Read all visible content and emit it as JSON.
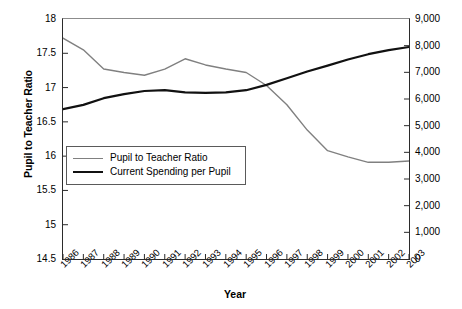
{
  "chart_data": {
    "type": "line",
    "title": "",
    "xlabel": "Year",
    "ylabel": "Pupil to Teacher Ratio",
    "ylabel_right": "",
    "grid": false,
    "legend_position": "inside-left-middle",
    "categories": [
      "1986",
      "1987",
      "1988",
      "1989",
      "1990",
      "1991",
      "1992",
      "1993",
      "1994",
      "1995",
      "1996",
      "1997",
      "1998",
      "1999",
      "2000",
      "2001",
      "2002",
      "2003"
    ],
    "ylim": [
      14.5,
      18
    ],
    "yticks": [
      "18",
      "17.5",
      "17",
      "16.5",
      "16",
      "15.5",
      "15",
      "14.5"
    ],
    "ytick_values": [
      18,
      17.5,
      17,
      16.5,
      16,
      15.5,
      15,
      14.5
    ],
    "ylim_right": [
      0,
      9000
    ],
    "yticks_right": [
      "9,000",
      "8,000",
      "7,000",
      "6,000",
      "5,000",
      "4,000",
      "3,000",
      "2,000",
      "1,000",
      "0"
    ],
    "ytick_values_right": [
      9000,
      8000,
      7000,
      6000,
      5000,
      4000,
      3000,
      2000,
      1000,
      0
    ],
    "series": [
      {
        "name": "Pupil to Teacher Ratio",
        "axis": "left",
        "color": "#808080",
        "values": [
          17.72,
          17.55,
          17.27,
          17.22,
          17.18,
          17.27,
          17.42,
          17.33,
          17.27,
          17.22,
          17.03,
          16.75,
          16.38,
          16.08,
          15.99,
          15.91,
          15.91,
          15.93
        ]
      },
      {
        "name": "Current Spending per Pupil",
        "axis": "right",
        "color": "#111111",
        "values": [
          5620,
          5780,
          6030,
          6180,
          6300,
          6330,
          6250,
          6230,
          6250,
          6330,
          6530,
          6780,
          7030,
          7250,
          7480,
          7680,
          7830,
          7950
        ]
      }
    ]
  },
  "legend": {
    "items": [
      {
        "label": "Pupil to Teacher Ratio",
        "color": "#808080"
      },
      {
        "label": "Current Spending per Pupil",
        "color": "#111111"
      }
    ]
  }
}
